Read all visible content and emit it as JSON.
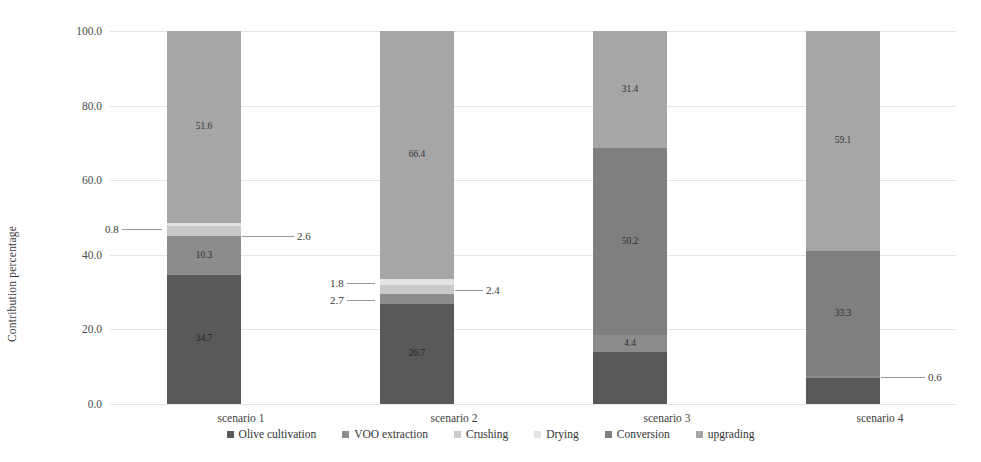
{
  "chart_data": {
    "type": "bar",
    "subtype": "stacked-100",
    "title": "",
    "xlabel": "",
    "ylabel": "Contribution percentage",
    "ylim": [
      0,
      100
    ],
    "yticks": [
      "0.0",
      "20.0",
      "40.0",
      "60.0",
      "80.0",
      "100.0"
    ],
    "ytick_values": [
      0,
      20,
      40,
      60,
      80,
      100
    ],
    "grid": true,
    "legend_position": "bottom",
    "categories": [
      "scenario 1",
      "scenario 2",
      "scenario 3",
      "scenario 4"
    ],
    "series": [
      {
        "name": "Olive cultivation",
        "color": "#595959",
        "values": [
          34.7,
          26.7,
          14.0,
          7.0
        ],
        "labels": [
          "34.7",
          "26.7",
          "",
          ""
        ]
      },
      {
        "name": "VOO extraction",
        "color": "#8c8c8c",
        "values": [
          10.3,
          2.7,
          4.4,
          0.6
        ],
        "labels": [
          "10.3",
          "2.7",
          "4.4",
          "0.6"
        ]
      },
      {
        "name": "Crushing",
        "color": "#c9c9c9",
        "values": [
          2.6,
          2.4,
          0.0,
          0.0
        ],
        "labels": [
          "2.6",
          "2.4",
          "",
          ""
        ]
      },
      {
        "name": "Drying",
        "color": "#e3e3e3",
        "values": [
          0.8,
          1.8,
          0.0,
          0.0
        ],
        "labels": [
          "0.8",
          "1.8",
          "",
          ""
        ]
      },
      {
        "name": "Conversion",
        "color": "#7f7f7f",
        "values": [
          0.0,
          0.0,
          50.2,
          33.3
        ],
        "labels": [
          "",
          "",
          "50.2",
          "33.3"
        ]
      },
      {
        "name": "upgrading",
        "color": "#a6a6a6",
        "values": [
          51.6,
          66.4,
          31.4,
          59.1
        ],
        "labels": [
          "51.6",
          "66.4",
          "31.4",
          "59.1"
        ]
      }
    ]
  },
  "axis": {
    "y_title": "Contribution percentage"
  },
  "callouts": [
    {
      "id": "c1-drying",
      "text": "0.8",
      "bar": 0,
      "side": "left",
      "value_at": 46.8,
      "leader": 40
    },
    {
      "id": "c1-crushing",
      "text": "2.6",
      "bar": 0,
      "side": "right",
      "value_at": 45.0,
      "leader": 52
    },
    {
      "id": "c2-drying",
      "text": "1.8",
      "bar": 1,
      "side": "left",
      "value_at": 32.5,
      "leader": 28
    },
    {
      "id": "c2-crushing",
      "text": "2.4",
      "bar": 1,
      "side": "right",
      "value_at": 30.6,
      "leader": 28
    },
    {
      "id": "c2-voo",
      "text": "2.7",
      "bar": 1,
      "side": "left",
      "value_at": 27.8,
      "leader": 28
    },
    {
      "id": "c4-voo",
      "text": "0.6",
      "bar": 3,
      "side": "right",
      "value_at": 7.3,
      "leader": 44
    }
  ]
}
